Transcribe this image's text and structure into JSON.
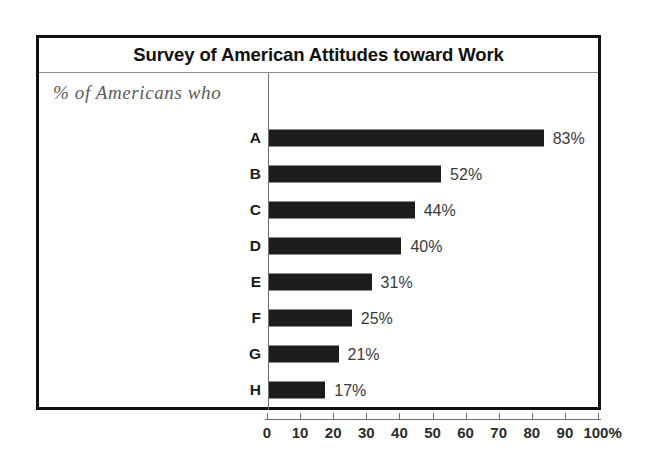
{
  "chart_data": {
    "type": "bar",
    "orientation": "horizontal",
    "title": "Survey of American Attitudes toward Work",
    "subtitle": "% of Americans who",
    "categories": [
      "A",
      "B",
      "C",
      "D",
      "E",
      "F",
      "G",
      "H"
    ],
    "values": [
      83,
      52,
      44,
      40,
      31,
      25,
      21,
      17
    ],
    "value_labels": [
      "83%",
      "52%",
      "44%",
      "40%",
      "31%",
      "25%",
      "21%",
      "17%"
    ],
    "xlabel": "",
    "ylabel": "",
    "xlim": [
      0,
      100
    ],
    "xticks": [
      0,
      10,
      20,
      30,
      40,
      50,
      60,
      70,
      80,
      90,
      100
    ],
    "xtick_labels": [
      "0",
      "10",
      "20",
      "30",
      "40",
      "50",
      "60",
      "70",
      "80",
      "90",
      "100%"
    ],
    "grid": false,
    "legend": false,
    "colors": {
      "bar": "#1c1c1c",
      "frame": "#111111",
      "axis": "#6f6f6f",
      "title_text": "#111111",
      "subtitle_text": "#5b5b5b",
      "value_text": "#3a3a3a",
      "background": "#ffffff"
    }
  }
}
